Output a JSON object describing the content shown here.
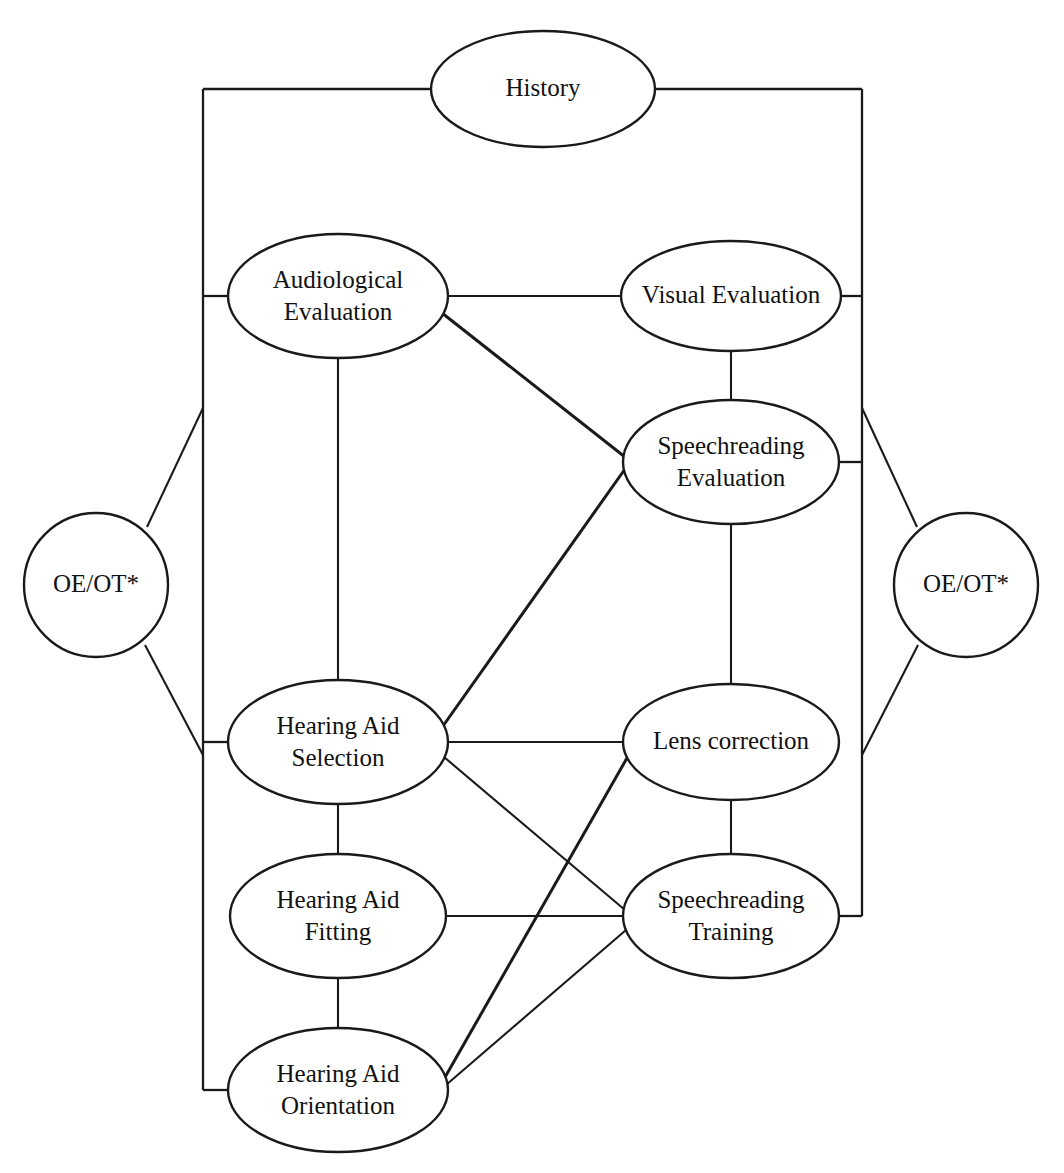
{
  "diagram": {
    "type": "flowchart",
    "background_color": "#ffffff",
    "line_color": "#1a1a1a",
    "text_color": "#111111",
    "nodes": [
      {
        "id": "history",
        "label_line1": "History",
        "label_line2": "",
        "shape": "ellipse",
        "cx": 543,
        "cy": 89,
        "rx": 112,
        "ry": 58
      },
      {
        "id": "audiological",
        "label_line1": "Audiological",
        "label_line2": "Evaluation",
        "shape": "ellipse",
        "cx": 338,
        "cy": 296,
        "rx": 110,
        "ry": 62
      },
      {
        "id": "visual",
        "label_line1": "Visual Evaluation",
        "label_line2": "",
        "shape": "ellipse",
        "cx": 731,
        "cy": 296,
        "rx": 110,
        "ry": 55
      },
      {
        "id": "speech-eval",
        "label_line1": "Speechreading",
        "label_line2": "Evaluation",
        "shape": "ellipse",
        "cx": 731,
        "cy": 462,
        "rx": 108,
        "ry": 62
      },
      {
        "id": "oeot-left",
        "label_line1": "OE/OT*",
        "label_line2": "",
        "shape": "circle",
        "cx": 96,
        "cy": 585,
        "rx": 72,
        "ry": 72
      },
      {
        "id": "oeot-right",
        "label_line1": "OE/OT*",
        "label_line2": "",
        "shape": "circle",
        "cx": 966,
        "cy": 585,
        "rx": 72,
        "ry": 72
      },
      {
        "id": "ha-selection",
        "label_line1": "Hearing Aid",
        "label_line2": "Selection",
        "shape": "ellipse",
        "cx": 338,
        "cy": 742,
        "rx": 110,
        "ry": 62
      },
      {
        "id": "lens",
        "label_line1": "Lens correction",
        "label_line2": "",
        "shape": "ellipse",
        "cx": 731,
        "cy": 742,
        "rx": 108,
        "ry": 58
      },
      {
        "id": "ha-fitting",
        "label_line1": "Hearing Aid",
        "label_line2": "Fitting",
        "shape": "ellipse",
        "cx": 338,
        "cy": 916,
        "rx": 108,
        "ry": 62
      },
      {
        "id": "speech-train",
        "label_line1": "Speechreading",
        "label_line2": "Training",
        "shape": "ellipse",
        "cx": 731,
        "cy": 916,
        "rx": 108,
        "ry": 62
      },
      {
        "id": "ha-orientation",
        "label_line1": "Hearing Aid",
        "label_line2": "Orientation",
        "shape": "ellipse",
        "cx": 338,
        "cy": 1090,
        "rx": 110,
        "ry": 62
      }
    ],
    "edges": [
      {
        "from": "history",
        "to": "left-rail",
        "kind": "rail-horizontal"
      },
      {
        "from": "history",
        "to": "right-rail",
        "kind": "rail-horizontal"
      },
      {
        "from": "left-rail",
        "to": "audiological",
        "kind": "rail-stub"
      },
      {
        "from": "left-rail",
        "to": "ha-selection",
        "kind": "rail-stub"
      },
      {
        "from": "left-rail",
        "to": "ha-orientation",
        "kind": "rail-stub"
      },
      {
        "from": "right-rail",
        "to": "visual",
        "kind": "rail-stub"
      },
      {
        "from": "right-rail",
        "to": "speech-eval",
        "kind": "rail-stub"
      },
      {
        "from": "right-rail",
        "to": "speech-train",
        "kind": "rail-stub"
      },
      {
        "from": "left-rail",
        "to": "oeot-left",
        "kind": "diagonal"
      },
      {
        "from": "oeot-left",
        "to": "left-rail",
        "kind": "diagonal"
      },
      {
        "from": "right-rail",
        "to": "oeot-right",
        "kind": "diagonal"
      },
      {
        "from": "oeot-right",
        "to": "right-rail",
        "kind": "diagonal"
      },
      {
        "from": "audiological",
        "to": "visual",
        "kind": "horizontal"
      },
      {
        "from": "audiological",
        "to": "ha-selection",
        "kind": "vertical"
      },
      {
        "from": "audiological",
        "to": "speech-eval",
        "kind": "diagonal"
      },
      {
        "from": "visual",
        "to": "speech-eval",
        "kind": "vertical"
      },
      {
        "from": "speech-eval",
        "to": "lens",
        "kind": "vertical"
      },
      {
        "from": "ha-selection",
        "to": "speech-eval",
        "kind": "diagonal"
      },
      {
        "from": "ha-selection",
        "to": "lens",
        "kind": "horizontal"
      },
      {
        "from": "ha-selection",
        "to": "ha-fitting",
        "kind": "vertical"
      },
      {
        "from": "ha-selection",
        "to": "speech-train",
        "kind": "diagonal"
      },
      {
        "from": "lens",
        "to": "speech-train",
        "kind": "vertical"
      },
      {
        "from": "lens",
        "to": "ha-orientation",
        "kind": "diagonal"
      },
      {
        "from": "ha-fitting",
        "to": "speech-train",
        "kind": "horizontal"
      },
      {
        "from": "ha-fitting",
        "to": "ha-orientation",
        "kind": "vertical"
      },
      {
        "from": "speech-train",
        "to": "ha-orientation",
        "kind": "diagonal"
      }
    ],
    "rails": {
      "left_x": 203,
      "right_x": 862,
      "top_y": 89,
      "left_bottom_y": 1090,
      "right_bottom_y": 916
    },
    "footnote_marker": "*"
  }
}
